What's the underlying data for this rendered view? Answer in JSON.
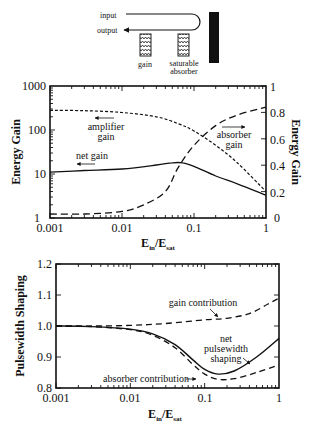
{
  "schematic": {
    "input_label": "input",
    "output_label": "output",
    "gain_label": "gain",
    "absorber_label_1": "saturable",
    "absorber_label_2": "absorber"
  },
  "chart_data": [
    {
      "type": "line",
      "title": "",
      "xlabel": "E_in/E_sat",
      "xlabel_main": "E",
      "xlabel_sub1": "in",
      "xlabel_sep": "/E",
      "xlabel_sub2": "sat",
      "ylabel": "Energy Gain",
      "ylabel_right": "Energy Gain",
      "xscale": "log",
      "yscale": "log",
      "xlim": [
        0.001,
        1
      ],
      "ylim": [
        1,
        1000
      ],
      "ylim_right": [
        0,
        1
      ],
      "x_ticks": [
        "0.001",
        "0.01",
        "0.1",
        "1"
      ],
      "y_ticks": [
        "1",
        "10",
        "100",
        "1000"
      ],
      "y_ticks_right": [
        "0",
        "0.2",
        "0.4",
        "0.6",
        "0.8",
        "1"
      ],
      "series": [
        {
          "name": "amplifier gain",
          "axis": "left",
          "style": "short-dash",
          "x": [
            0.001,
            0.003,
            0.01,
            0.03,
            0.06,
            0.1,
            0.2,
            0.4,
            1
          ],
          "values": [
            280,
            275,
            250,
            200,
            140,
            95,
            45,
            18,
            4
          ]
        },
        {
          "name": "net gain",
          "axis": "left",
          "style": "solid",
          "x": [
            0.001,
            0.003,
            0.01,
            0.03,
            0.05,
            0.07,
            0.1,
            0.2,
            0.4,
            1
          ],
          "values": [
            11,
            12,
            13,
            16,
            18,
            18,
            15,
            9,
            6,
            3.3
          ]
        },
        {
          "name": "absorber gain",
          "axis": "right",
          "style": "long-dash",
          "x": [
            0.001,
            0.003,
            0.01,
            0.02,
            0.04,
            0.06,
            0.1,
            0.2,
            0.4,
            1
          ],
          "values": [
            0.03,
            0.03,
            0.05,
            0.1,
            0.2,
            0.38,
            0.55,
            0.7,
            0.78,
            0.84
          ]
        }
      ],
      "annotations": [
        {
          "text": "amplifier",
          "text2": "gain"
        },
        {
          "text": "net gain"
        },
        {
          "text": "absorber",
          "text2": "gain"
        }
      ]
    },
    {
      "type": "line",
      "title": "",
      "xlabel": "E_in/E_sat",
      "xlabel_main": "E",
      "xlabel_sub1": "in",
      "xlabel_sep": "/E",
      "xlabel_sub2": "sat",
      "ylabel": "Pulsewidth Shaping",
      "xscale": "log",
      "yscale": "linear",
      "xlim": [
        0.001,
        1
      ],
      "ylim": [
        0.8,
        1.2
      ],
      "x_ticks": [
        "0.001",
        "0.01",
        "0.1",
        "1"
      ],
      "y_ticks": [
        "0.8",
        "0.9",
        "1.0",
        "1.1",
        "1.2"
      ],
      "series": [
        {
          "name": "gain contribution",
          "style": "dash",
          "x": [
            0.001,
            0.003,
            0.01,
            0.03,
            0.1,
            0.2,
            0.4,
            0.7,
            1
          ],
          "values": [
            1.0,
            1.0,
            1.002,
            1.008,
            1.02,
            1.025,
            1.04,
            1.07,
            1.09
          ]
        },
        {
          "name": "net pulsewidth shaping",
          "style": "solid",
          "x": [
            0.001,
            0.003,
            0.01,
            0.02,
            0.04,
            0.07,
            0.1,
            0.15,
            0.25,
            0.5,
            1
          ],
          "values": [
            1.0,
            0.998,
            0.99,
            0.975,
            0.94,
            0.89,
            0.86,
            0.845,
            0.855,
            0.9,
            0.96
          ]
        },
        {
          "name": "absorber contribution",
          "style": "dash",
          "x": [
            0.001,
            0.003,
            0.01,
            0.02,
            0.04,
            0.07,
            0.1,
            0.15,
            0.25,
            0.5,
            1
          ],
          "values": [
            1.0,
            0.998,
            0.988,
            0.97,
            0.93,
            0.875,
            0.845,
            0.828,
            0.83,
            0.85,
            0.875
          ]
        }
      ],
      "annotations": [
        {
          "text": "gain contribution"
        },
        {
          "text": "net",
          "text2": "pulsewidth",
          "text3": "shaping"
        },
        {
          "text": "absorber contribution"
        }
      ]
    }
  ]
}
